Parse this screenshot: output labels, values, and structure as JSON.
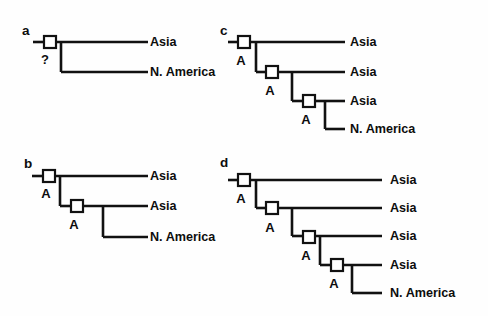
{
  "figure": {
    "background_color": "#ffffff",
    "line_color": "#111111",
    "node_fill_color": "#ffffff",
    "text_color": "#0d0d0d",
    "node_glyph": "open-square"
  },
  "panels": [
    {
      "id": "a",
      "letter": "a",
      "letter_pos": {
        "x": 22,
        "y": 24
      },
      "tips": [
        {
          "label": "Asia",
          "x": 150,
          "y": 42
        },
        {
          "label": "N. America",
          "x": 150,
          "y": 72
        }
      ],
      "nodes": [
        {
          "label": "?",
          "label_x": 45,
          "label_y": 59,
          "sq_x": 44,
          "sq_y": 36
        }
      ],
      "segments": [
        {
          "type": "h",
          "x1": 33,
          "x2": 44,
          "y": 42
        },
        {
          "type": "h",
          "x1": 56,
          "x2": 148,
          "y": 42
        },
        {
          "type": "v",
          "x": 61,
          "y1": 42,
          "y2": 72
        },
        {
          "type": "h",
          "x1": 61,
          "x2": 148,
          "y": 72
        }
      ]
    },
    {
      "id": "b",
      "letter": "b",
      "letter_pos": {
        "x": 24,
        "y": 157
      },
      "tips": [
        {
          "label": "Asia",
          "x": 150,
          "y": 176
        },
        {
          "label": "Asia",
          "x": 150,
          "y": 206
        },
        {
          "label": "N. America",
          "x": 150,
          "y": 237
        }
      ],
      "nodes": [
        {
          "label": "A",
          "label_x": 46,
          "label_y": 193,
          "sq_x": 43,
          "sq_y": 170
        },
        {
          "label": "A",
          "label_x": 74,
          "label_y": 224,
          "sq_x": 71,
          "sq_y": 200
        }
      ],
      "segments": [
        {
          "type": "h",
          "x1": 32,
          "x2": 43,
          "y": 176
        },
        {
          "type": "h",
          "x1": 55,
          "x2": 148,
          "y": 176
        },
        {
          "type": "v",
          "x": 60,
          "y1": 176,
          "y2": 206
        },
        {
          "type": "h",
          "x1": 60,
          "x2": 71,
          "y": 206
        },
        {
          "type": "h",
          "x1": 83,
          "x2": 148,
          "y": 206
        },
        {
          "type": "v",
          "x": 103,
          "y1": 206,
          "y2": 237
        },
        {
          "type": "h",
          "x1": 103,
          "x2": 148,
          "y": 237
        }
      ]
    },
    {
      "id": "c",
      "letter": "c",
      "letter_pos": {
        "x": 220,
        "y": 24
      },
      "tips": [
        {
          "label": "Asia",
          "x": 350,
          "y": 42
        },
        {
          "label": "Asia",
          "x": 350,
          "y": 72
        },
        {
          "label": "Asia",
          "x": 350,
          "y": 101
        },
        {
          "label": "N. America",
          "x": 350,
          "y": 129
        }
      ],
      "nodes": [
        {
          "label": "A",
          "label_x": 241,
          "label_y": 60,
          "sq_x": 238,
          "sq_y": 36
        },
        {
          "label": "A",
          "label_x": 270,
          "label_y": 90,
          "sq_x": 266,
          "sq_y": 66
        },
        {
          "label": "A",
          "label_x": 306,
          "label_y": 119,
          "sq_x": 303,
          "sq_y": 95
        }
      ],
      "segments": [
        {
          "type": "h",
          "x1": 228,
          "x2": 238,
          "y": 42
        },
        {
          "type": "h",
          "x1": 250,
          "x2": 345,
          "y": 42
        },
        {
          "type": "v",
          "x": 256,
          "y1": 42,
          "y2": 72
        },
        {
          "type": "h",
          "x1": 256,
          "x2": 266,
          "y": 72
        },
        {
          "type": "h",
          "x1": 278,
          "x2": 345,
          "y": 72
        },
        {
          "type": "v",
          "x": 292,
          "y1": 72,
          "y2": 101
        },
        {
          "type": "h",
          "x1": 292,
          "x2": 303,
          "y": 101
        },
        {
          "type": "h",
          "x1": 315,
          "x2": 345,
          "y": 101
        },
        {
          "type": "v",
          "x": 325,
          "y1": 101,
          "y2": 129
        },
        {
          "type": "h",
          "x1": 325,
          "x2": 345,
          "y": 129
        }
      ]
    },
    {
      "id": "d",
      "letter": "d",
      "letter_pos": {
        "x": 220,
        "y": 156
      },
      "tips": [
        {
          "label": "Asia",
          "x": 390,
          "y": 180
        },
        {
          "label": "Asia",
          "x": 390,
          "y": 208
        },
        {
          "label": "Asia",
          "x": 390,
          "y": 236
        },
        {
          "label": "Asia",
          "x": 390,
          "y": 265
        },
        {
          "label": "N. America",
          "x": 390,
          "y": 293
        }
      ],
      "nodes": [
        {
          "label": "A",
          "label_x": 241,
          "label_y": 198,
          "sq_x": 238,
          "sq_y": 174
        },
        {
          "label": "A",
          "label_x": 270,
          "label_y": 227,
          "sq_x": 266,
          "sq_y": 202
        },
        {
          "label": "A",
          "label_x": 306,
          "label_y": 255,
          "sq_x": 303,
          "sq_y": 231
        },
        {
          "label": "A",
          "label_x": 334,
          "label_y": 283,
          "sq_x": 331,
          "sq_y": 259
        }
      ],
      "segments": [
        {
          "type": "h",
          "x1": 228,
          "x2": 238,
          "y": 180
        },
        {
          "type": "h",
          "x1": 250,
          "x2": 382,
          "y": 180
        },
        {
          "type": "v",
          "x": 256,
          "y1": 180,
          "y2": 208
        },
        {
          "type": "h",
          "x1": 256,
          "x2": 266,
          "y": 208
        },
        {
          "type": "h",
          "x1": 278,
          "x2": 382,
          "y": 208
        },
        {
          "type": "v",
          "x": 292,
          "y1": 208,
          "y2": 236
        },
        {
          "type": "h",
          "x1": 292,
          "x2": 303,
          "y": 236
        },
        {
          "type": "h",
          "x1": 315,
          "x2": 382,
          "y": 236
        },
        {
          "type": "v",
          "x": 320,
          "y1": 236,
          "y2": 265
        },
        {
          "type": "h",
          "x1": 320,
          "x2": 331,
          "y": 265
        },
        {
          "type": "h",
          "x1": 343,
          "x2": 382,
          "y": 265
        },
        {
          "type": "v",
          "x": 352,
          "y1": 265,
          "y2": 293
        },
        {
          "type": "h",
          "x1": 352,
          "x2": 382,
          "y": 293
        }
      ]
    }
  ],
  "node_square_size": 12
}
